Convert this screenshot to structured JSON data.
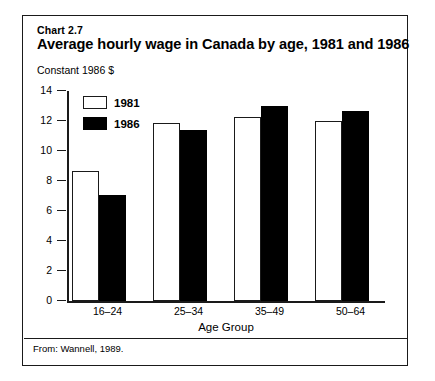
{
  "chart_label": "Chart 2.7",
  "title": "Average hourly wage in Canada by age, 1981 and 1986",
  "unit_label": "Constant 1986 $",
  "source_note": "From: Wannell, 1989.",
  "legend": {
    "items": [
      {
        "label": "1981",
        "swatch": "white-box-outlined",
        "color": "#ffffff"
      },
      {
        "label": "1986",
        "swatch": "black-box-filled",
        "color": "#000000"
      }
    ]
  },
  "chart_data": {
    "type": "bar",
    "title": "Average hourly wage in Canada by age, 1981 and 1986",
    "xlabel": "Age Group",
    "ylabel": "Constant 1986 $",
    "categories": [
      "16–24",
      "25–34",
      "35–49",
      "50–64"
    ],
    "series": [
      {
        "name": "1981",
        "values": [
          8.7,
          11.9,
          12.3,
          12.0
        ],
        "color": "#ffffff"
      },
      {
        "name": "1986",
        "values": [
          7.1,
          11.4,
          13.0,
          12.7
        ],
        "color": "#000000"
      }
    ],
    "ylim": [
      0,
      14
    ],
    "yticks": [
      0,
      2,
      4,
      6,
      8,
      10,
      12,
      14
    ],
    "ytick_labels": [
      "0",
      "2",
      "4",
      "6",
      "8",
      "10",
      "12",
      "14"
    ],
    "grid": false,
    "legend_position": "upper-left-inside"
  }
}
